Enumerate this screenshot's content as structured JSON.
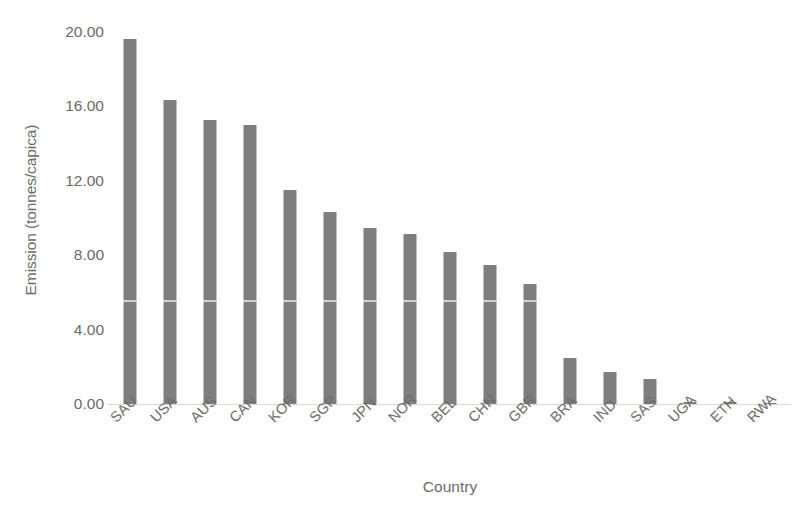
{
  "chart_data": {
    "type": "bar",
    "title": "",
    "subtitle": "",
    "xlabel": "Country",
    "ylabel": "Emission (tonnes/capica)",
    "categories": [
      "SAU",
      "USA",
      "AUS",
      "CAN",
      "KOR",
      "SGP",
      "JPN",
      "NOR",
      "BEL",
      "CHN",
      "GBR",
      "BRA",
      "IND",
      "SAS",
      "UGA",
      "ETH",
      "RWA"
    ],
    "values": [
      19.6,
      16.35,
      15.25,
      15.0,
      11.5,
      10.3,
      9.45,
      9.15,
      8.15,
      7.45,
      6.45,
      2.5,
      1.7,
      1.35,
      0.12,
      0.1,
      0.06
    ],
    "series": [
      {
        "name": "Emission",
        "values": [
          19.6,
          16.35,
          15.25,
          15.0,
          11.5,
          10.3,
          9.45,
          9.15,
          8.15,
          7.45,
          6.45,
          2.5,
          1.7,
          1.35,
          0.12,
          0.1,
          0.06
        ]
      }
    ],
    "ylim": [
      0,
      20
    ],
    "ytick_step": 4,
    "ytick_labels": [
      "20.00",
      "16.00",
      "12.00",
      "8.00",
      "4.00",
      "0.00"
    ],
    "ytick_values": [
      20,
      16,
      12,
      8,
      4,
      0
    ],
    "grid": false,
    "legend": false,
    "legend_position": "none",
    "bar_color": "#7e7e7e",
    "axis_color": "#d9d9d9",
    "text_color": "#6b6b6b",
    "background": "#ffffff",
    "xtick_rotation": -45
  }
}
